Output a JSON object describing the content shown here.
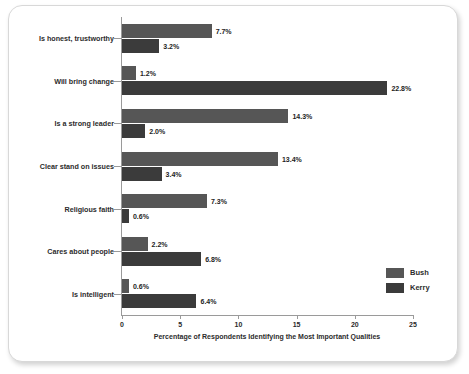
{
  "chart_data": {
    "type": "bar",
    "orientation": "horizontal",
    "title": "",
    "xlabel": "Percentage of Respondents Identifying the Most Important Qualities",
    "ylabel": "",
    "xlim": [
      0,
      25
    ],
    "xticks": [
      "0",
      "5",
      "10",
      "15",
      "20",
      "25"
    ],
    "grid": false,
    "legend_position": "bottom-right",
    "categories": [
      "Is honest, trustworthy",
      "Will bring change",
      "Is a strong leader",
      "Clear stand on issues",
      "Religious faith",
      "Cares about people",
      "Is intelligent"
    ],
    "series": [
      {
        "name": "Bush",
        "color": "#565656",
        "values": [
          7.7,
          1.2,
          14.3,
          13.4,
          7.3,
          2.2,
          0.6
        ],
        "labels": [
          "7.7%",
          "1.2%",
          "14.3%",
          "13.4%",
          "7.3%",
          "2.2%",
          "0.6%"
        ]
      },
      {
        "name": "Kerry",
        "color": "#3b3b3b",
        "values": [
          3.2,
          22.8,
          2.0,
          3.4,
          0.6,
          6.8,
          6.4
        ],
        "labels": [
          "3.2%",
          "22.8%",
          "2.0%",
          "3.4%",
          "0.6%",
          "6.8%",
          "6.4%"
        ]
      }
    ]
  },
  "legend": {
    "items": [
      {
        "label": "Bush",
        "color": "#565656"
      },
      {
        "label": "Kerry",
        "color": "#3b3b3b"
      }
    ]
  },
  "axis": {
    "x_title": "Percentage of Respondents Identifying the Most Important Qualities",
    "x_tick_labels": [
      "0",
      "5",
      "10",
      "15",
      "20",
      "25"
    ]
  },
  "colors": {
    "bush": "#565656",
    "kerry": "#3b3b3b",
    "axis": "#9a9a9a",
    "text": "#2c2c2c",
    "frame_border": "#d8d8d8",
    "background": "#ffffff"
  }
}
